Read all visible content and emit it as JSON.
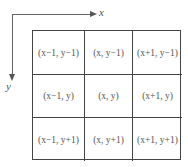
{
  "axes": {
    "x_label": "x",
    "y_label": "y"
  },
  "grid": {
    "rows": [
      [
        "(x−1, y−1)",
        "(x, y−1)",
        "(x+1, y−1)"
      ],
      [
        "(x−1, y)",
        "(x, y)",
        "(x+1, y)"
      ],
      [
        "(x−1, y+1)",
        "(x, y+1)",
        "(x+1, y+1)"
      ]
    ]
  }
}
